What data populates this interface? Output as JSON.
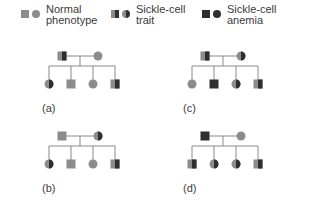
{
  "legend": [
    {
      "label_line1": "Normal",
      "label_line2": "phenotype",
      "type": "normal"
    },
    {
      "label_line1": "Sickle-cell",
      "label_line2": "trait",
      "type": "trait"
    },
    {
      "label_line1": "Sickle-cell",
      "label_line2": "anemia",
      "type": "anemia"
    }
  ],
  "colors": {
    "normal": "#8c8c8c",
    "affected": "#2f2f2f",
    "line": "#8a8a8a"
  },
  "pedigrees": [
    {
      "label": "(a)",
      "father": "trait",
      "mother": "normal",
      "children": [
        {
          "sex": "female",
          "type": "trait"
        },
        {
          "sex": "male",
          "type": "normal"
        },
        {
          "sex": "female",
          "type": "normal"
        },
        {
          "sex": "male",
          "type": "trait"
        }
      ]
    },
    {
      "label": "(b)",
      "father": "normal",
      "mother": "trait",
      "children": [
        {
          "sex": "female",
          "type": "trait"
        },
        {
          "sex": "male",
          "type": "normal"
        },
        {
          "sex": "female",
          "type": "normal"
        },
        {
          "sex": "male",
          "type": "trait"
        }
      ]
    },
    {
      "label": "(c)",
      "father": "trait",
      "mother": "trait",
      "children": [
        {
          "sex": "female",
          "type": "normal"
        },
        {
          "sex": "male",
          "type": "anemia"
        },
        {
          "sex": "female",
          "type": "trait"
        },
        {
          "sex": "male",
          "type": "trait"
        }
      ]
    },
    {
      "label": "(d)",
      "father": "anemia",
      "mother": "normal",
      "children": [
        {
          "sex": "male",
          "type": "trait"
        },
        {
          "sex": "female",
          "type": "trait"
        },
        {
          "sex": "female",
          "type": "trait"
        },
        {
          "sex": "male",
          "type": "trait"
        }
      ]
    }
  ]
}
